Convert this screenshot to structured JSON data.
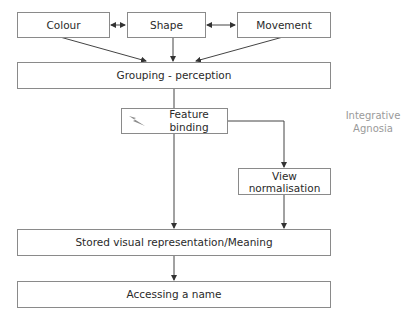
{
  "diagram": {
    "nodes": {
      "colour": {
        "label": "Colour"
      },
      "shape": {
        "label": "Shape"
      },
      "movement": {
        "label": "Movement"
      },
      "grouping": {
        "label": "Grouping - perception"
      },
      "feature_binding": {
        "label": "Feature binding",
        "icon": "lightning-bolt-icon"
      },
      "view_normalisation": {
        "label_line1": "View",
        "label_line2": "normalisation"
      },
      "stored": {
        "label": "Stored visual representation/Meaning"
      },
      "accessing": {
        "label": "Accessing a name"
      }
    },
    "annotation": {
      "line1": "Integrative",
      "line2": "Agnosia"
    },
    "edges": [
      {
        "from": "colour",
        "to": "shape",
        "type": "bidirectional"
      },
      {
        "from": "shape",
        "to": "movement",
        "type": "bidirectional"
      },
      {
        "from": "colour",
        "to": "grouping"
      },
      {
        "from": "shape",
        "to": "grouping"
      },
      {
        "from": "movement",
        "to": "grouping"
      },
      {
        "from": "grouping",
        "to": "feature_binding"
      },
      {
        "from": "feature_binding",
        "to": "view_normalisation"
      },
      {
        "from": "feature_binding",
        "to": "stored"
      },
      {
        "from": "view_normalisation",
        "to": "stored"
      },
      {
        "from": "stored",
        "to": "accessing"
      }
    ],
    "colors": {
      "border": "#8a8a8a",
      "line": "#444444",
      "text": "#2a2a2a",
      "annotation": "#9a9a9a"
    }
  }
}
